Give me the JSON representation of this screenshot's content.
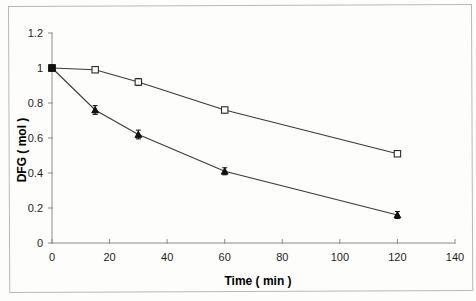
{
  "chart_data": {
    "type": "line",
    "title": "",
    "xlabel": "Time ( min )",
    "ylabel": "DFG ( mol )",
    "xlim": [
      0,
      140
    ],
    "ylim": [
      0,
      1.2
    ],
    "xticks": [
      0,
      20,
      40,
      60,
      80,
      100,
      120,
      140
    ],
    "yticks": [
      0,
      0.2,
      0.4,
      0.6,
      0.8,
      1,
      1.2
    ],
    "xtick_labels": [
      "0",
      "20",
      "40",
      "60",
      "80",
      "100",
      "120",
      "140"
    ],
    "ytick_labels": [
      "0",
      "0.2",
      "0.4",
      "0.6",
      "0.8",
      "1",
      "1.2"
    ],
    "grid": false,
    "legend": "none",
    "series": [
      {
        "name": "open-square-series",
        "marker": "open-square",
        "x": [
          0,
          15,
          30,
          60,
          120
        ],
        "values": [
          1.0,
          0.99,
          0.92,
          0.76,
          0.51
        ],
        "errors": [
          0.0,
          0.015,
          0.02,
          0.015,
          0.015
        ]
      },
      {
        "name": "filled-triangle-series",
        "marker": "filled-triangle",
        "x": [
          0,
          15,
          30,
          60,
          120
        ],
        "values": [
          1.0,
          0.76,
          0.62,
          0.41,
          0.16
        ],
        "errors": [
          0.0,
          0.025,
          0.025,
          0.02,
          0.02
        ]
      }
    ]
  },
  "axes": {
    "x_title": "Time ( min )",
    "y_title": "DFG ( mol )"
  }
}
